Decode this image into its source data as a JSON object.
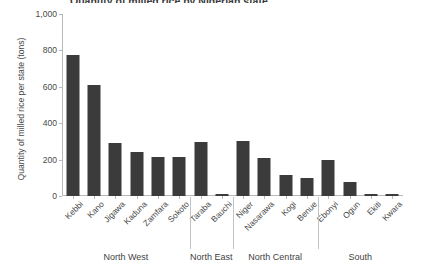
{
  "figure": {
    "title_fragment": "Quantity of milled rice by Nigerian state",
    "bar_color": "#3b3b3b",
    "axis_color": "#b9b9b9",
    "text_color": "#4a4a4a"
  },
  "chart_data": {
    "type": "bar",
    "title": "",
    "xlabel": "",
    "ylabel": "Quantity of milled rice per state (tons)",
    "ylim": [
      0,
      1000
    ],
    "yticks": [
      0,
      200,
      400,
      600,
      800,
      1000
    ],
    "ytick_labels": [
      "0",
      "200",
      "400",
      "600",
      "800",
      "1,000"
    ],
    "grid": false,
    "legend": "none",
    "categories": [
      "Kebbi",
      "Kano",
      "Jigawa",
      "Kaduna",
      "Zamfara",
      "Sokoto",
      "Taraba",
      "Bauchi",
      "Niger",
      "Nasarawa",
      "Kogi",
      "Benue",
      "Ebonyi",
      "Ogun",
      "Ekiti",
      "Kwara"
    ],
    "values": [
      775,
      610,
      290,
      240,
      212,
      212,
      296,
      10,
      305,
      210,
      115,
      100,
      200,
      75,
      10,
      10
    ],
    "groups": [
      {
        "label": "North West",
        "start": 0,
        "end": 5
      },
      {
        "label": "North East",
        "start": 6,
        "end": 7
      },
      {
        "label": "North Central",
        "start": 8,
        "end": 11
      },
      {
        "label": "South",
        "start": 12,
        "end": 15
      }
    ]
  }
}
